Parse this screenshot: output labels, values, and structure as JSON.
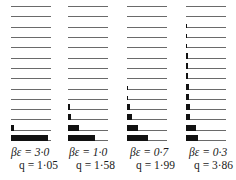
{
  "chart_data": {
    "type": "bar",
    "orientation": "horizontal",
    "title": "",
    "xlabel": "",
    "ylabel": "",
    "grid": false,
    "levels": [
      1,
      2,
      3,
      4,
      5,
      6,
      7,
      8,
      9,
      10,
      11,
      12,
      13,
      14
    ],
    "xlim": [
      0,
      40
    ],
    "series": [
      {
        "name": "βε=3·0, q=1·05",
        "beta_eps": "βε = 3·0",
        "q": "q = 1·05",
        "values": [
          37,
          3,
          0,
          0,
          0,
          0,
          0,
          0,
          0,
          0,
          0,
          0,
          0,
          0
        ]
      },
      {
        "name": "βε=1·0, q=1·58",
        "beta_eps": "βε = 1·0",
        "q": "q = 1·58",
        "values": [
          27,
          11,
          3,
          2,
          0,
          0,
          0,
          0,
          0,
          0,
          0,
          0,
          0,
          0
        ]
      },
      {
        "name": "βε=0·7, q=1·99",
        "beta_eps": "βε = 0·7",
        "q": "q = 1·99",
        "values": [
          21,
          11,
          5,
          3,
          1,
          1,
          0,
          0,
          0,
          0,
          0,
          0,
          0,
          0
        ]
      },
      {
        "name": "βε=0·3, q=3·86",
        "beta_eps": "βε = 0·3",
        "q": "q = 3·86",
        "values": [
          12,
          10,
          4,
          4,
          3,
          3,
          2,
          2,
          2,
          1,
          1,
          1,
          0,
          0
        ]
      }
    ]
  },
  "panels": [
    {
      "beta_eps": "βε = 3·0",
      "q": "q = 1·05"
    },
    {
      "beta_eps": "βε = 1·0",
      "q": "q = 1·58"
    },
    {
      "beta_eps": "βε = 0·7",
      "q": "q = 1·99"
    },
    {
      "beta_eps": "βε = 0·3",
      "q": "q = 3·86"
    }
  ]
}
